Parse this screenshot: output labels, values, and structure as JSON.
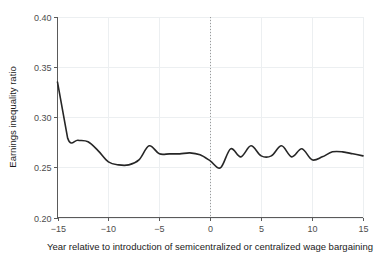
{
  "chart_data": {
    "type": "line",
    "title": "",
    "xlabel": "Year relative to introduction of semicentralized or centralized wage bargaining",
    "ylabel": "Earnings inequality ratio",
    "xlim": [
      -15,
      15
    ],
    "ylim": [
      0.2,
      0.4
    ],
    "xticks": [
      -15,
      -10,
      -5,
      0,
      5,
      10,
      15
    ],
    "xtick_labels": [
      "−15",
      "−10",
      "−5",
      "0",
      "5",
      "10",
      "15"
    ],
    "yticks": [
      0.2,
      0.25,
      0.3,
      0.35,
      0.4
    ],
    "ytick_labels": [
      "0.20",
      "0.25",
      "0.30",
      "0.35",
      "0.40"
    ],
    "grid": "faint gridlines at tick positions",
    "legend": "none",
    "annotations": [
      {
        "name": "reference-line-year-zero",
        "type": "vertical-dotted-line",
        "x": 0,
        "style": "dotted",
        "color": "#9a9a9a"
      }
    ],
    "line_color": "#262626",
    "series": [
      {
        "name": "Earnings inequality ratio",
        "x": [
          -15,
          -14,
          -13,
          -12,
          -11,
          -10,
          -9,
          -8,
          -7,
          -6,
          -5,
          -4,
          -3,
          -2,
          -1,
          0,
          1,
          2,
          3,
          4,
          5,
          6,
          7,
          8,
          9,
          10,
          11,
          12,
          13,
          14,
          15
        ],
        "values": [
          0.335,
          0.279,
          0.277,
          0.2755,
          0.2665,
          0.2555,
          0.2525,
          0.2525,
          0.2575,
          0.2715,
          0.2635,
          0.2635,
          0.2635,
          0.2645,
          0.2625,
          0.2565,
          0.2495,
          0.2685,
          0.2605,
          0.2715,
          0.2615,
          0.2615,
          0.2715,
          0.2605,
          0.2685,
          0.2575,
          0.2605,
          0.2655,
          0.2655,
          0.2635,
          0.2615
        ]
      }
    ]
  },
  "axis": {
    "ylabel": "Earnings inequality ratio",
    "xlabel": "Year relative to introduction of semicentralized or centralized wage bargaining"
  }
}
